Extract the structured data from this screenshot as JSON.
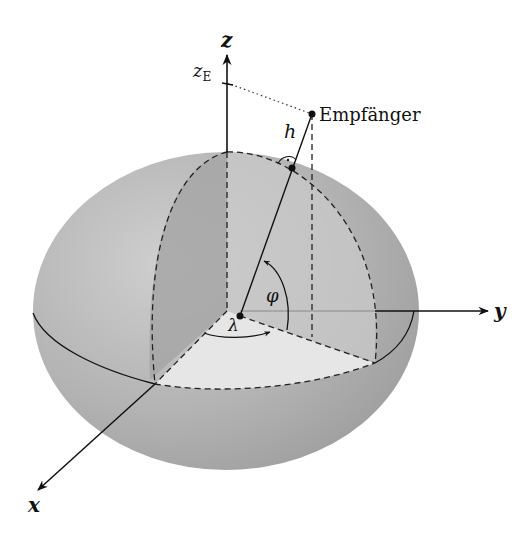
{
  "figure": {
    "type": "ellipsoid-coordinate-diagram",
    "colors": {
      "ellipsoid_fill": "#b0b0b0",
      "ellipsoid_light": "#cdcdcd",
      "ellipsoid_dark": "#9c9c9c",
      "meridian_slice": "#a8a8a8",
      "equator_wedge": "#e4e4e4",
      "line": "#111111"
    }
  },
  "axes": {
    "x_label": "x",
    "y_label": "y",
    "z_label": "z",
    "z_tick_label": "z",
    "z_tick_subscript": "E"
  },
  "labels": {
    "receiver": "Empfänger",
    "height": "h",
    "latitude": "φ",
    "longitude": "λ",
    "right_angle_mark": "·"
  }
}
